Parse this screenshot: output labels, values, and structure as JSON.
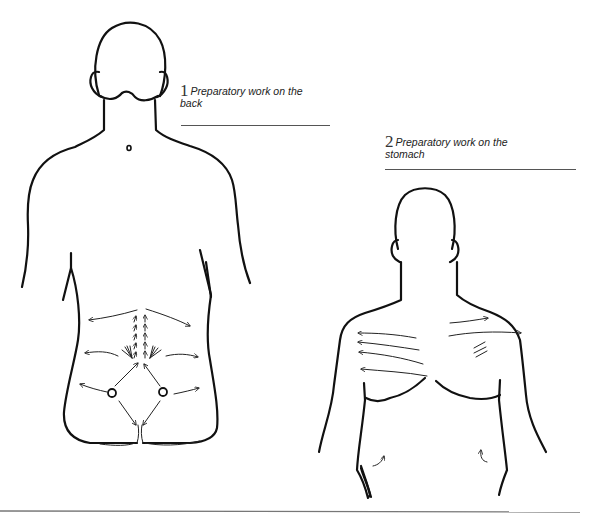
{
  "figures": [
    {
      "number": "1",
      "caption": "Preparatory work on the",
      "caption_line2": "back",
      "subject": "back-view-figure"
    },
    {
      "number": "2",
      "caption": "Preparatory work on the",
      "caption_line2": "stomach",
      "subject": "front-view-figure"
    }
  ],
  "colors": {
    "background": "#ffffff",
    "line": "#111111",
    "rule": "#555555"
  }
}
